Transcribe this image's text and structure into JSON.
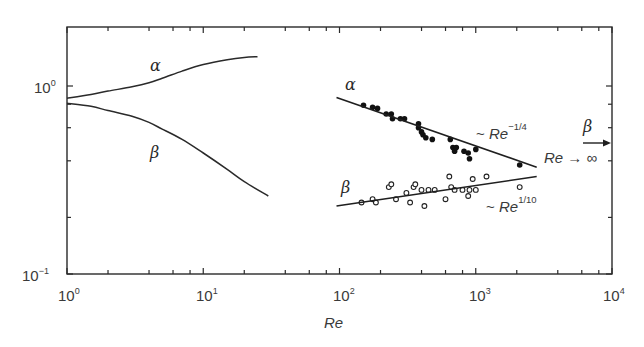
{
  "chart_data": {
    "type": "line",
    "title": "",
    "xlabel": "Re",
    "ylabel": "",
    "xscale": "log",
    "yscale": "log",
    "xlim": [
      1,
      10000
    ],
    "ylim": [
      0.1,
      2.1
    ],
    "grid": false,
    "legend": null,
    "x_ticks": [
      {
        "value": 1,
        "base": "10",
        "exp": "0"
      },
      {
        "value": 10,
        "base": "10",
        "exp": "1"
      },
      {
        "value": 100,
        "base": "10",
        "exp": "2"
      },
      {
        "value": 1000,
        "base": "10",
        "exp": "3"
      },
      {
        "value": 10000,
        "base": "10",
        "exp": "4"
      }
    ],
    "y_ticks": [
      {
        "value": 1,
        "base": "10",
        "exp": "0"
      },
      {
        "value": 0.1,
        "base": "10",
        "exp": "−1"
      }
    ],
    "series": [
      {
        "name": "alpha (low Re)",
        "label": "α",
        "style": "line",
        "x": [
          1,
          1.5,
          2,
          3,
          4,
          5,
          7,
          10,
          15,
          20,
          25
        ],
        "y": [
          0.86,
          0.9,
          0.94,
          0.99,
          1.04,
          1.1,
          1.2,
          1.3,
          1.38,
          1.42,
          1.43
        ]
      },
      {
        "name": "beta (low Re)",
        "label": "β",
        "style": "line",
        "x": [
          1,
          1.5,
          2,
          3,
          4,
          5,
          7,
          10,
          15,
          20,
          30
        ],
        "y": [
          0.81,
          0.78,
          0.74,
          0.69,
          0.64,
          0.59,
          0.52,
          0.44,
          0.36,
          0.31,
          0.26
        ]
      },
      {
        "name": "alpha data",
        "label": "α",
        "style": "filled-markers",
        "x": [
          150,
          175,
          190,
          220,
          240,
          245,
          280,
          300,
          380,
          380,
          400,
          410,
          430,
          480,
          650,
          680,
          700,
          720,
          820,
          880,
          900,
          1000,
          2100
        ],
        "y": [
          0.79,
          0.77,
          0.76,
          0.71,
          0.71,
          0.67,
          0.67,
          0.67,
          0.63,
          0.6,
          0.57,
          0.55,
          0.53,
          0.52,
          0.52,
          0.47,
          0.45,
          0.47,
          0.45,
          0.44,
          0.41,
          0.46,
          0.38
        ]
      },
      {
        "name": "beta data",
        "label": "β",
        "style": "open-markers",
        "x": [
          145,
          175,
          185,
          230,
          240,
          260,
          310,
          330,
          350,
          360,
          400,
          420,
          450,
          500,
          600,
          640,
          660,
          700,
          800,
          880,
          900,
          950,
          1000,
          1200,
          2100
        ],
        "y": [
          0.24,
          0.25,
          0.24,
          0.29,
          0.3,
          0.25,
          0.27,
          0.24,
          0.29,
          0.3,
          0.28,
          0.23,
          0.28,
          0.28,
          0.25,
          0.33,
          0.29,
          0.28,
          0.28,
          0.26,
          0.28,
          0.32,
          0.28,
          0.33,
          0.29
        ]
      },
      {
        "name": "alpha fit",
        "label": "~ Re^-1/4",
        "style": "line",
        "x": [
          95,
          2800
        ],
        "y": [
          0.87,
          0.37
        ]
      },
      {
        "name": "beta fit",
        "label": "~ Re^1/10",
        "style": "line",
        "x": [
          95,
          2800
        ],
        "y": [
          0.23,
          0.33
        ]
      }
    ],
    "annotations": [
      {
        "text": "α",
        "near": "upper low-Re curve",
        "x": 3.5,
        "y": 1.2
      },
      {
        "text": "β",
        "near": "lower low-Re curve",
        "x": 3.5,
        "y": 0.5
      },
      {
        "text": "α",
        "near": "alpha data",
        "x": 100,
        "y": 0.95
      },
      {
        "text": "β",
        "near": "beta data",
        "x": 100,
        "y": 0.26
      },
      {
        "text": "~ Re^-1/4",
        "near": "alpha fit"
      },
      {
        "text": "~ Re^1/10",
        "near": "beta fit"
      },
      {
        "text": "β arrow, Re → ∞",
        "y": 0.5,
        "meaning": "asymptotic beta value as Re tends to infinity"
      }
    ]
  },
  "labels": {
    "xlabel": "Re",
    "alpha": "α",
    "beta": "β",
    "alpha_fit_prefix": "~ ",
    "alpha_fit_base": "Re",
    "alpha_fit_exp": "−1/4",
    "beta_fit_prefix": "~ ",
    "beta_fit_base": "Re",
    "beta_fit_exp": "1/10",
    "limit_text_base": "Re",
    "limit_text_arrow": " → ∞",
    "x10": "10",
    "x_exp": [
      "0",
      "1",
      "2",
      "3",
      "4"
    ],
    "y_exp_top": "0",
    "y_exp_bottom": "−1"
  }
}
